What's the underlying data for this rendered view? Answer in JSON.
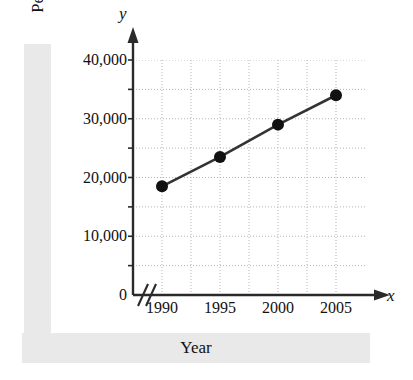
{
  "figure": {
    "background_color": "#ffffff",
    "band_color": "#e9e9e9",
    "ink_color": "#111111",
    "grid_color": "#b4b4b4",
    "series_color": "#333333"
  },
  "labels": {
    "y_axis_title": "Per Capita Income (dollars)",
    "x_axis_title": "Year",
    "y_axis_letter": "y",
    "x_axis_letter": "x"
  },
  "chart_data": {
    "type": "line",
    "title": "",
    "xlabel": "Year",
    "ylabel": "Per Capita Income (dollars)",
    "x": [
      1990,
      1995,
      2000,
      2005
    ],
    "categories": [
      "1990",
      "1995",
      "2000",
      "2005"
    ],
    "values": [
      18500,
      23500,
      29000,
      34000
    ],
    "series": [
      {
        "name": "Per Capita Income",
        "values": [
          18500,
          23500,
          29000,
          34000
        ]
      }
    ],
    "xlim": [
      1987.5,
      2007.5
    ],
    "ylim": [
      0,
      40000
    ],
    "xticks": [
      1990,
      1995,
      2000,
      2005
    ],
    "xtick_labels": [
      "1990",
      "1995",
      "2000",
      "2005"
    ],
    "yticks": [
      0,
      10000,
      20000,
      30000,
      40000
    ],
    "ytick_labels": [
      "0",
      "10,000",
      "20,000",
      "30,000",
      "40,000"
    ],
    "y_minor_ticks": [
      5000,
      15000,
      25000,
      35000
    ],
    "x_minor_ticks": [
      1992.5,
      1997.5,
      2002.5
    ],
    "grid": true,
    "grid_style": "dotted",
    "legend": "none",
    "marker": "filled-circle",
    "axis_break_x": true,
    "annotations": []
  }
}
